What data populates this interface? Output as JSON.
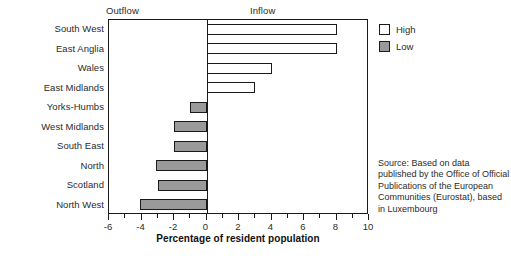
{
  "chart_data": {
    "type": "bar",
    "orientation": "horizontal",
    "title": "",
    "xlabel": "Percentage of resident population",
    "ylabel": "",
    "xlim": [
      -6,
      10
    ],
    "xticks": [
      -6,
      -4,
      -2,
      0,
      2,
      4,
      6,
      8,
      10
    ],
    "xtick_labels": [
      "-6",
      "-4",
      "-2",
      "0",
      "2",
      "4",
      "6",
      "8",
      "10"
    ],
    "minor_ticks": [
      -5,
      -3,
      -1,
      1,
      3,
      5,
      7,
      9
    ],
    "grid": false,
    "categories": [
      "South West",
      "East Anglia",
      "Wales",
      "East Midlands",
      "Yorks-Humbs",
      "West Midlands",
      "South East",
      "North",
      "Scotland",
      "North West"
    ],
    "values": [
      8.0,
      8.0,
      4.0,
      3.0,
      -1.0,
      -2.0,
      -2.0,
      -3.1,
      -3.0,
      -4.1
    ],
    "bar_series": [
      "High",
      "High",
      "High",
      "High",
      "Low",
      "Low",
      "Low",
      "Low",
      "Low",
      "Low"
    ],
    "legend": {
      "position": "top-right",
      "entries": [
        {
          "label": "High",
          "fill": "#ffffff",
          "stroke": "#1a1a1a"
        },
        {
          "label": "Low",
          "fill": "#9a9a9a",
          "stroke": "#1a1a1a"
        }
      ]
    },
    "annotations": {
      "left_header": "Outflow",
      "right_header": "Inflow"
    }
  },
  "headers": {
    "outflow": "Outflow",
    "inflow": "Inflow"
  },
  "axis": {
    "x_title": "Percentage of resident population"
  },
  "legend": {
    "high_label": "High",
    "low_label": "Low"
  },
  "source": {
    "text": "Source: Based on data published by the Office of Official Publications of the European Communities (Eurostat), based in Luxembourg"
  },
  "colors": {
    "high_fill": "#ffffff",
    "low_fill": "#9a9a9a",
    "stroke": "#1a1a1a",
    "background": "#ffffff"
  }
}
